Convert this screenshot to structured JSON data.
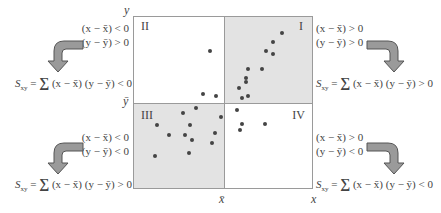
{
  "axes": {
    "y_label": "y",
    "x_label": "x",
    "y_mean_label": "ȳ",
    "x_mean_label": "x̄"
  },
  "quadrants": {
    "I": {
      "label": "I",
      "shaded": true
    },
    "II": {
      "label": "II",
      "shaded": false
    },
    "III": {
      "label": "III",
      "shaded": true
    },
    "IV": {
      "label": "IV",
      "shaded": false
    }
  },
  "annotations": {
    "top_left": {
      "cond1": "(x − x̄) < 0",
      "cond2": "(y − ȳ) > 0",
      "formula_S": "S",
      "formula_sub": "xy",
      "formula_rest": " = ",
      "sigma": "∑",
      "formula_tail": " (x − x̄) (y − ȳ) < 0"
    },
    "top_right": {
      "cond1": "(x − x̄) > 0",
      "cond2": "(y − ȳ) > 0",
      "formula_S": "S",
      "formula_sub": "xy",
      "formula_rest": " = ",
      "sigma": "∑",
      "formula_tail": " (x − x̄) (y − ȳ) > 0"
    },
    "bottom_left": {
      "cond1": "(x − x̄) < 0",
      "cond2": "(y − ȳ) < 0",
      "formula_S": "S",
      "formula_sub": "xy",
      "formula_rest": " = ",
      "sigma": "∑",
      "formula_tail": " (x − x̄) (y − ȳ) > 0"
    },
    "bottom_right": {
      "cond1": "(x − x̄) > 0",
      "cond2": "(y − ȳ) < 0",
      "formula_S": "S",
      "formula_sub": "xy",
      "formula_rest": " = ",
      "sigma": "∑",
      "formula_tail": " (x − x̄) (y − ȳ) < 0"
    }
  },
  "colors": {
    "shade": "#e3e3e3",
    "arrow_fill": "#9a9a9a",
    "arrow_stroke": "#555555",
    "dot": "#444444"
  },
  "points": [
    [
      282,
      33
    ],
    [
      273,
      42
    ],
    [
      266,
      51
    ],
    [
      273,
      54
    ],
    [
      248,
      69
    ],
    [
      262,
      69
    ],
    [
      246,
      78
    ],
    [
      246,
      82
    ],
    [
      239,
      88
    ],
    [
      248,
      96
    ],
    [
      242,
      98
    ],
    [
      210,
      51
    ],
    [
      203,
      94
    ],
    [
      216,
      96
    ],
    [
      196,
      108
    ],
    [
      183,
      113
    ],
    [
      157,
      125
    ],
    [
      190,
      125
    ],
    [
      169,
      135
    ],
    [
      185,
      135
    ],
    [
      192,
      140
    ],
    [
      215,
      133
    ],
    [
      212,
      143
    ],
    [
      155,
      156
    ],
    [
      189,
      153
    ],
    [
      221,
      117
    ],
    [
      237,
      110
    ],
    [
      242,
      124
    ],
    [
      240,
      130
    ],
    [
      265,
      124
    ]
  ]
}
